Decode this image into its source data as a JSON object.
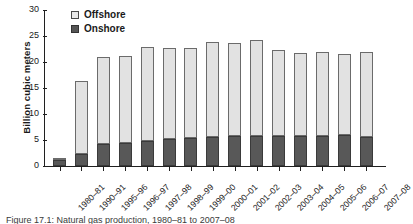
{
  "chart_data": {
    "type": "bar",
    "title": "",
    "xlabel": "",
    "ylabel": "Billion cubic meters",
    "ylim": [
      0,
      30
    ],
    "yticks": [
      0,
      5,
      10,
      15,
      20,
      25,
      30
    ],
    "grid": false,
    "stacked": true,
    "legend_position": "top-left",
    "categories": [
      "1980–81",
      "1990–91",
      "1995–96",
      "1996–97",
      "1997–98",
      "1998–99",
      "1999–00",
      "2000–01",
      "2001–02",
      "2002–03",
      "2003–04",
      "2004–05",
      "2005–06",
      "2006–07",
      "2007–08"
    ],
    "series": [
      {
        "name": "Onshore",
        "color": "#585858",
        "values": [
          1.1,
          2.3,
          4.3,
          4.5,
          4.9,
          5.2,
          5.4,
          5.5,
          5.8,
          5.8,
          5.7,
          5.7,
          5.7,
          5.9,
          5.6
        ]
      },
      {
        "name": "Offshore",
        "color": "#e2e2e2",
        "values": [
          0.5,
          14.1,
          16.6,
          16.7,
          18.0,
          17.5,
          17.2,
          18.4,
          17.9,
          18.4,
          16.6,
          16.1,
          16.2,
          15.6,
          16.4
        ]
      }
    ],
    "totals": [
      1.6,
      16.4,
      20.9,
      21.2,
      22.9,
      22.7,
      22.6,
      23.9,
      23.7,
      24.2,
      22.3,
      21.8,
      21.9,
      21.5,
      22.0
    ]
  },
  "legend": {
    "items": [
      {
        "label": "Offshore",
        "swatch": "light-square-swatch"
      },
      {
        "label": "Onshore",
        "swatch": "dark-square-swatch"
      }
    ]
  },
  "caption": {
    "text": "Figure 17.1: Natural gas production, 1980–81 to 2007–08"
  }
}
